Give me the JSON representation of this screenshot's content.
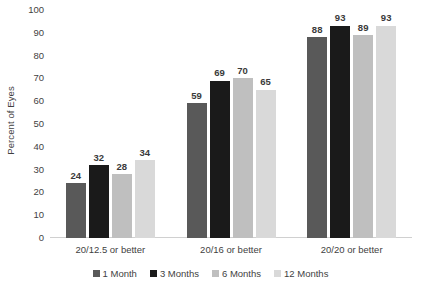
{
  "chart_data": {
    "type": "bar",
    "title": "",
    "subtitle": "",
    "xlabel": "",
    "ylabel": "Percent of Eyes",
    "ylim": [
      0,
      100
    ],
    "ytick_step": 10,
    "yticks": [
      100,
      90,
      80,
      70,
      60,
      50,
      40,
      30,
      20,
      10,
      0
    ],
    "ytick_labels": [
      "100",
      "90",
      "80",
      "70",
      "60",
      "50",
      "40",
      "30",
      "20",
      "10",
      "0"
    ],
    "grid": false,
    "legend_position": "bottom-center",
    "categories": [
      "20/12.5 or better",
      "20/16 or better",
      "20/20 or better"
    ],
    "series": [
      {
        "name": "1 Month",
        "color": "#595959",
        "values": [
          24,
          59,
          88
        ],
        "labels": [
          "24",
          "59",
          "88"
        ]
      },
      {
        "name": "3 Months",
        "color": "#1a1a1a",
        "values": [
          32,
          69,
          93
        ],
        "labels": [
          "32",
          "69",
          "93"
        ]
      },
      {
        "name": "6 Months",
        "color": "#bfbfbf",
        "values": [
          28,
          70,
          89
        ],
        "labels": [
          "28",
          "70",
          "89"
        ]
      },
      {
        "name": "12 Months",
        "color": "#d9d9d9",
        "values": [
          34,
          65,
          93
        ],
        "labels": [
          "34",
          "65",
          "93"
        ]
      }
    ]
  },
  "colors": {
    "background": "#ffffff",
    "axis_line": "#d0d0d0",
    "text": "#3f3f3f",
    "value_label": "#3a3a3a"
  }
}
